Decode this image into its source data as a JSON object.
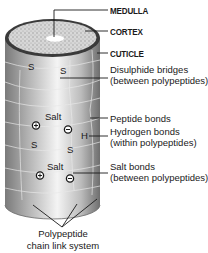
{
  "diagram": {
    "type": "hair-structure-cross-section",
    "labels": {
      "medulla": "MEDULLA",
      "cortex": "CORTEX",
      "cuticle": "CUTICLE",
      "disulphide_1": "Disulphide bridges",
      "disulphide_2": "(between polypeptides)",
      "peptide": "Peptide bonds",
      "hydrogen_1": "Hydrogen bonds",
      "hydrogen_2": "(within polypeptides)",
      "salt_1": "Salt bonds",
      "salt_2": "(between polypeptides)",
      "chain_1": "Polypeptide",
      "chain_2": "chain link system"
    },
    "on_hair_marks": {
      "s1": "S",
      "s2": "S",
      "s3": "S",
      "s4": "S",
      "salt_top": "Salt",
      "salt_bottom": "Salt",
      "h": "H",
      "plus": "+",
      "minus": "−"
    },
    "colors": {
      "cortex_fill": "#cfcfcf",
      "cuticle_rim": "#3a3a3a",
      "shaft_dark": "#7d7d7d",
      "shaft_light": "#f2f2f2",
      "text": "#1a1a1a"
    }
  }
}
